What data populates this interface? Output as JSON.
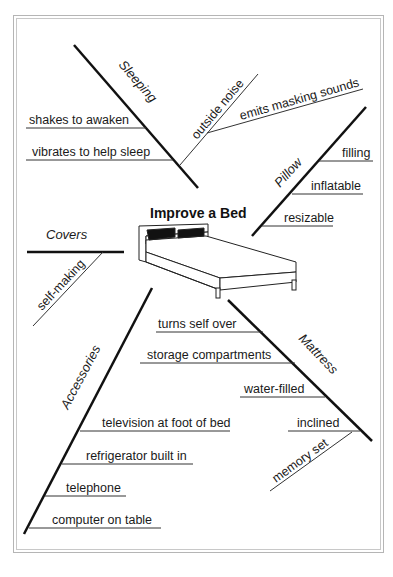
{
  "title": "Improve a Bed",
  "branches": {
    "sleeping": {
      "label": "Sleeping",
      "items": [
        "shakes to awaken",
        "vibrates to help sleep"
      ],
      "sub": {
        "label": "outside noise",
        "items": [
          "emits masking sounds"
        ]
      }
    },
    "pillow": {
      "label": "Pillow",
      "items": [
        "filling",
        "inflatable",
        "resizable"
      ]
    },
    "covers": {
      "label": "Covers",
      "items": [
        "self-making"
      ]
    },
    "accessories": {
      "label": "Accessories",
      "items": [
        "television at foot of bed",
        "refrigerator built in",
        "telephone",
        "computer on table"
      ]
    },
    "mattress": {
      "label": "Mattress",
      "items": [
        "turns self over",
        "storage compartments",
        "water-filled",
        "inclined",
        "memory set"
      ]
    }
  },
  "colors": {
    "line": "#111111",
    "frame": "#b5b5b5",
    "background": "#ffffff"
  }
}
